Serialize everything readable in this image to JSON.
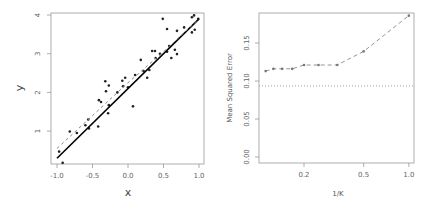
{
  "chart_data": [
    {
      "type": "scatter",
      "title": "",
      "xlabel": "x",
      "ylabel": "y",
      "xlim": [
        -1.05,
        1.07
      ],
      "ylim": [
        0.15,
        4.05
      ],
      "xticks": [
        "-1.0",
        "-0.5",
        "0.0",
        "0.5",
        "1.0"
      ],
      "xtick_values": [
        -1.0,
        -0.5,
        0.0,
        0.5,
        1.0
      ],
      "yticks": [
        "1",
        "2",
        "3",
        "4"
      ],
      "ytick_values": [
        1,
        2,
        3,
        4
      ],
      "grid": false,
      "series": [
        {
          "name": "observations",
          "style": "points",
          "color": "#222222",
          "points": [
            [
              -0.97,
              0.47
            ],
            [
              -0.92,
              0.18
            ],
            [
              -0.82,
              0.99
            ],
            [
              -0.56,
              1.3
            ],
            [
              -0.55,
              1.07
            ],
            [
              -0.42,
              1.12
            ],
            [
              -0.41,
              1.8
            ],
            [
              -0.38,
              1.75
            ],
            [
              -0.32,
              2.29
            ],
            [
              -0.31,
              2.03
            ],
            [
              -0.27,
              2.18
            ],
            [
              -0.28,
              1.46
            ],
            [
              -0.27,
              1.67
            ],
            [
              -0.08,
              2.3
            ],
            [
              -0.07,
              2.16
            ],
            [
              -0.04,
              2.38
            ],
            [
              0.0,
              2.13
            ],
            [
              0.07,
              1.64
            ],
            [
              0.1,
              2.45
            ],
            [
              0.18,
              2.84
            ],
            [
              0.27,
              2.38
            ],
            [
              0.3,
              2.58
            ],
            [
              0.34,
              3.07
            ],
            [
              0.38,
              3.07
            ],
            [
              0.39,
              2.89
            ],
            [
              0.49,
              3.9
            ],
            [
              0.55,
              3.64
            ],
            [
              0.55,
              3.05
            ],
            [
              0.61,
              2.89
            ],
            [
              0.66,
              3.1
            ],
            [
              0.69,
              2.99
            ],
            [
              0.69,
              3.59
            ],
            [
              0.79,
              3.68
            ],
            [
              0.9,
              3.55
            ],
            [
              0.9,
              3.94
            ],
            [
              0.93,
              3.99
            ],
            [
              0.94,
              3.62
            ],
            [
              0.99,
              3.9
            ],
            [
              0.58,
              3.2
            ],
            [
              0.22,
              2.55
            ],
            [
              -0.6,
              1.15
            ],
            [
              -0.15,
              2.0
            ],
            [
              0.45,
              3.0
            ],
            [
              -0.72,
              0.95
            ]
          ]
        },
        {
          "name": "true relationship",
          "style": "solid",
          "color": "#000000",
          "points": [
            [
              -1.0,
              0.3
            ],
            [
              1.0,
              3.9
            ]
          ]
        },
        {
          "name": "KNN fit",
          "style": "dashed",
          "color": "#888888",
          "points": [
            [
              -1.0,
              0.55
            ],
            [
              -0.5,
              1.4
            ],
            [
              0.0,
              2.25
            ],
            [
              0.5,
              3.05
            ],
            [
              1.0,
              3.9
            ]
          ]
        }
      ]
    },
    {
      "type": "line",
      "title": "",
      "xlabel": "1/K",
      "ylabel": "Mean Squared Error",
      "xscale": "log",
      "xlim": [
        0.1,
        1.05
      ],
      "ylim": [
        0.0,
        0.19
      ],
      "xticks": [
        "0.2",
        "0.5",
        "1.0"
      ],
      "xtick_values": [
        0.2,
        0.5,
        1.0
      ],
      "yticks": [
        "0.00",
        "0.05",
        "0.10",
        "0.15"
      ],
      "ytick_values": [
        0.0,
        0.05,
        0.1,
        0.15
      ],
      "grid": false,
      "series": [
        {
          "name": "KNN test MSE",
          "style": "dashed-with-points",
          "color": "#888888",
          "x": [
            0.111,
            0.125,
            0.143,
            0.167,
            0.2,
            0.25,
            0.333,
            0.5,
            1.0
          ],
          "values": [
            0.113,
            0.116,
            0.116,
            0.116,
            0.121,
            0.121,
            0.121,
            0.139,
            0.186
          ]
        },
        {
          "name": "linear regression test MSE",
          "style": "dotted-horizontal",
          "color": "#888888",
          "value": 0.0935
        }
      ]
    }
  ]
}
